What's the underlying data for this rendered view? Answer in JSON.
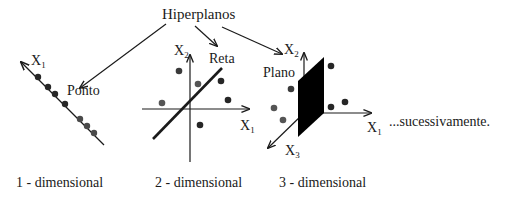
{
  "title": "Hiperplanos",
  "panels": [
    {
      "id": "1d",
      "hyperplane_label": "Ponto",
      "axes": [
        {
          "name": "X",
          "sub": "1"
        }
      ],
      "caption": "1 - dimensional"
    },
    {
      "id": "2d",
      "hyperplane_label": "Reta",
      "axes": [
        {
          "name": "X",
          "sub": "2"
        },
        {
          "name": "X",
          "sub": "1"
        }
      ],
      "caption": "2 - dimensional"
    },
    {
      "id": "3d",
      "hyperplane_label": "Plano",
      "axes": [
        {
          "name": "X",
          "sub": "2"
        },
        {
          "name": "X",
          "sub": "1"
        },
        {
          "name": "X",
          "sub": "3"
        }
      ],
      "caption": "3 - dimensional"
    }
  ],
  "continuation": "...sucessivamente.",
  "colors": {
    "ink": "#1a1a1a",
    "point_dark": "#262626",
    "point_gray": "#555555",
    "plane_fill": "#000000"
  }
}
